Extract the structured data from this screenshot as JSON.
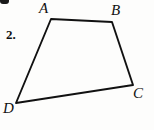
{
  "figure": {
    "problem_number": "2.",
    "background_color": "#fdfdfc",
    "stroke_color": "#111111",
    "labels": {
      "a": "A",
      "b": "B",
      "c": "C",
      "d": "D"
    },
    "vertices": [
      {
        "name": "A",
        "x": 51,
        "y": 19
      },
      {
        "name": "B",
        "x": 112,
        "y": 22
      },
      {
        "name": "C",
        "x": 133,
        "y": 85
      },
      {
        "name": "D",
        "x": 16,
        "y": 103
      }
    ],
    "edges": [
      {
        "from": "A",
        "to": "B"
      },
      {
        "from": "B",
        "to": "C"
      },
      {
        "from": "C",
        "to": "D"
      },
      {
        "from": "D",
        "to": "A"
      }
    ],
    "shape": "quadrilateral",
    "polygon_points": "51,19 112,22 133,85 16,103"
  }
}
